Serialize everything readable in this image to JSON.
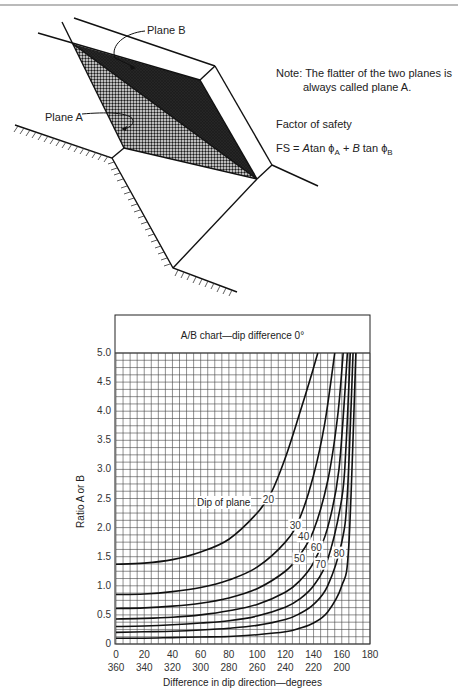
{
  "diagram": {
    "plane_b_label": "Plane B",
    "plane_a_label": "Plane A",
    "note_line1": "Note: The flatter of the two planes is",
    "note_line2": "always called plane A.",
    "fos_title": "Factor of safety",
    "formula": {
      "lhs": "FS =",
      "a": "A",
      "tan1": "tan",
      "phi": "ϕ",
      "subA": "A",
      "plus": "+",
      "b": "B",
      "tan2": "tan",
      "subB": "B"
    }
  },
  "chart_data": {
    "type": "line",
    "title": "A/B chart—dip difference 0°",
    "xlabel": "Difference in dip direction—degrees",
    "ylabel": "Ratio A or B",
    "xlim": [
      0,
      180
    ],
    "ylim": [
      0,
      5.0
    ],
    "grid": true,
    "x_ticks": [
      "0",
      "20",
      "40",
      "60",
      "80",
      "100",
      "120",
      "140",
      "160",
      "180"
    ],
    "x_ticks_secondary": [
      "360",
      "340",
      "320",
      "300",
      "280",
      "260",
      "240",
      "220",
      "200"
    ],
    "y_ticks": [
      "0",
      "0.5",
      "1.0",
      "1.5",
      "2.0",
      "2.5",
      "3.0",
      "3.5",
      "4.0",
      "4.5",
      "5.0"
    ],
    "annotation": "Dip of plane",
    "series": [
      {
        "name": "20",
        "x": [
          0,
          20,
          40,
          60,
          80,
          100,
          110,
          120,
          130,
          137,
          143
        ],
        "values": [
          1.37,
          1.39,
          1.45,
          1.58,
          1.8,
          2.25,
          2.6,
          3.2,
          3.95,
          4.5,
          5.0
        ]
      },
      {
        "name": "30",
        "x": [
          0,
          20,
          40,
          60,
          80,
          100,
          120,
          130,
          140,
          148,
          155
        ],
        "values": [
          0.85,
          0.86,
          0.9,
          0.97,
          1.1,
          1.32,
          1.75,
          2.15,
          2.9,
          3.8,
          5.0
        ]
      },
      {
        "name": "40",
        "x": [
          0,
          20,
          40,
          60,
          80,
          100,
          120,
          130,
          140,
          150,
          157,
          161
        ],
        "values": [
          0.61,
          0.62,
          0.65,
          0.7,
          0.79,
          0.95,
          1.25,
          1.52,
          1.95,
          2.8,
          3.9,
          5.0
        ]
      },
      {
        "name": "50",
        "x": [
          0,
          20,
          40,
          60,
          80,
          100,
          120,
          130,
          140,
          150,
          158,
          164
        ],
        "values": [
          0.43,
          0.44,
          0.46,
          0.5,
          0.57,
          0.68,
          0.89,
          1.08,
          1.4,
          2.0,
          3.0,
          5.0
        ]
      },
      {
        "name": "60",
        "x": [
          0,
          20,
          40,
          60,
          80,
          100,
          120,
          130,
          140,
          150,
          160,
          163,
          166
        ],
        "values": [
          0.3,
          0.31,
          0.33,
          0.36,
          0.4,
          0.48,
          0.63,
          0.77,
          1.0,
          1.45,
          2.5,
          3.4,
          5.0
        ]
      },
      {
        "name": "70",
        "x": [
          0,
          20,
          40,
          60,
          80,
          100,
          120,
          130,
          140,
          150,
          160,
          164,
          168
        ],
        "values": [
          0.2,
          0.21,
          0.22,
          0.24,
          0.27,
          0.32,
          0.42,
          0.52,
          0.68,
          1.0,
          1.75,
          2.6,
          5.0
        ]
      },
      {
        "name": "80",
        "x": [
          0,
          20,
          40,
          60,
          80,
          100,
          120,
          130,
          140,
          150,
          160,
          165,
          170
        ],
        "values": [
          0.1,
          0.1,
          0.11,
          0.12,
          0.13,
          0.16,
          0.21,
          0.27,
          0.36,
          0.55,
          1.0,
          1.7,
          5.0
        ]
      }
    ],
    "curve_labels": [
      {
        "text": "20",
        "x": 108,
        "y": 2.5
      },
      {
        "text": "30",
        "x": 127,
        "y": 2.05
      },
      {
        "text": "40",
        "x": 133,
        "y": 1.85
      },
      {
        "text": "50",
        "x": 130,
        "y": 1.47
      },
      {
        "text": "60",
        "x": 142,
        "y": 1.67
      },
      {
        "text": "70",
        "x": 145,
        "y": 1.38
      },
      {
        "text": "80",
        "x": 158,
        "y": 1.57
      }
    ]
  }
}
